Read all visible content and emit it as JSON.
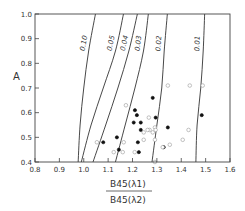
{
  "chart_data": {
    "type": "scatter",
    "title": "",
    "xlabel_numerator": "B45(λ1)",
    "xlabel_denominator": "B45(λ2)",
    "ylabel": "A",
    "xlim": [
      0.8,
      1.6
    ],
    "ylim": [
      0.4,
      1.0
    ],
    "x_ticks": [
      "0.8",
      "0.9",
      "1.0",
      "1.1",
      "1.2",
      "1.3",
      "1.4",
      "1.5",
      "1.6"
    ],
    "y_ticks": [
      "0.4",
      "0.5",
      "0.6",
      "0.7",
      "0.8",
      "0.9",
      "1.0"
    ],
    "grid": false,
    "legend": null,
    "curves": [
      {
        "label": "0.10",
        "points": [
          [
            0.977,
            0.4
          ],
          [
            0.985,
            0.55
          ],
          [
            1.0,
            0.7
          ],
          [
            1.02,
            0.85
          ],
          [
            1.048,
            1.0
          ]
        ]
      },
      {
        "label": "0.05",
        "points": [
          [
            0.99,
            0.4
          ],
          [
            1.03,
            0.55
          ],
          [
            1.08,
            0.7
          ],
          [
            1.13,
            0.85
          ],
          [
            1.163,
            1.0
          ]
        ]
      },
      {
        "label": "0.04",
        "points": [
          [
            1.038,
            0.4
          ],
          [
            1.09,
            0.55
          ],
          [
            1.14,
            0.7
          ],
          [
            1.185,
            0.85
          ],
          [
            1.22,
            1.0
          ]
        ]
      },
      {
        "label": "0.03",
        "points": [
          [
            1.13,
            0.4
          ],
          [
            1.17,
            0.55
          ],
          [
            1.21,
            0.7
          ],
          [
            1.245,
            0.85
          ],
          [
            1.265,
            1.0
          ]
        ]
      },
      {
        "label": "0.02",
        "points": [
          [
            1.28,
            0.4
          ],
          [
            1.3,
            0.55
          ],
          [
            1.32,
            0.7
          ],
          [
            1.33,
            0.85
          ],
          [
            1.343,
            1.0
          ]
        ]
      },
      {
        "label": "0.01",
        "points": [
          [
            1.46,
            0.4
          ],
          [
            1.465,
            0.55
          ],
          [
            1.48,
            0.7
          ],
          [
            1.49,
            0.85
          ],
          [
            1.496,
            1.0
          ]
        ]
      }
    ],
    "series": [
      {
        "name": "filled",
        "marker": "filled-circle",
        "points": [
          [
            1.283,
            0.66
          ],
          [
            1.21,
            0.61
          ],
          [
            1.218,
            0.59
          ],
          [
            1.205,
            0.56
          ],
          [
            1.234,
            0.56
          ],
          [
            1.295,
            0.58
          ],
          [
            1.234,
            0.53
          ],
          [
            1.345,
            0.54
          ],
          [
            1.08,
            0.48
          ],
          [
            1.136,
            0.5
          ],
          [
            1.144,
            0.45
          ],
          [
            1.222,
            0.48
          ],
          [
            1.226,
            0.44
          ],
          [
            1.328,
            0.46
          ],
          [
            1.484,
            0.59
          ]
        ]
      },
      {
        "name": "open",
        "marker": "open-circle",
        "points": [
          [
            1.345,
            0.71
          ],
          [
            1.173,
            0.63
          ],
          [
            1.267,
            0.58
          ],
          [
            1.292,
            0.54
          ],
          [
            1.283,
            0.52
          ],
          [
            1.27,
            0.53
          ],
          [
            1.262,
            0.53
          ],
          [
            1.246,
            0.52
          ],
          [
            1.295,
            0.53
          ],
          [
            1.164,
            0.48
          ],
          [
            1.16,
            0.44
          ],
          [
            1.123,
            0.44
          ],
          [
            1.054,
            0.48
          ],
          [
            1.246,
            0.49
          ],
          [
            1.292,
            0.49
          ],
          [
            1.406,
            0.49
          ],
          [
            1.43,
            0.53
          ],
          [
            1.324,
            0.46
          ],
          [
            1.353,
            0.47
          ],
          [
            1.209,
            0.44
          ],
          [
            1.435,
            0.71
          ],
          [
            1.488,
            0.71
          ],
          [
            1.292,
            0.4
          ]
        ]
      }
    ]
  }
}
